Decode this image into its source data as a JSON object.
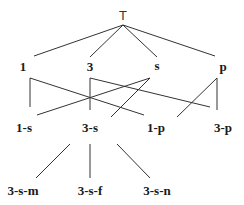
{
  "diagram": {
    "type": "lattice",
    "nodes": {
      "top": "T",
      "n1": "1",
      "n3": "3",
      "ns": "s",
      "np": "p",
      "n1s": "1-s",
      "n3s": "3-s",
      "n1p": "1-p",
      "n3p": "3-p",
      "n3sm": "3-s-m",
      "n3sf": "3-s-f",
      "n3sn": "3-s-n"
    },
    "edges": [
      [
        "T",
        "1"
      ],
      [
        "T",
        "3"
      ],
      [
        "T",
        "s"
      ],
      [
        "T",
        "p"
      ],
      [
        "1",
        "1-s"
      ],
      [
        "1",
        "1-p"
      ],
      [
        "3",
        "3-s"
      ],
      [
        "3",
        "3-p"
      ],
      [
        "s",
        "1-s"
      ],
      [
        "s",
        "3-s"
      ],
      [
        "p",
        "1-p"
      ],
      [
        "p",
        "3-p"
      ],
      [
        "3-s",
        "3-s-m"
      ],
      [
        "3-s",
        "3-s-f"
      ],
      [
        "3-s",
        "3-s-n"
      ]
    ],
    "line_color": "#333333"
  }
}
